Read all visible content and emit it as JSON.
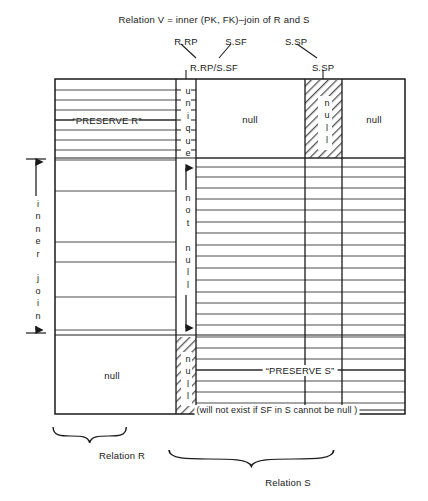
{
  "diagram": {
    "title": "Relation V = inner (PK, FK)–join of R and S",
    "top_labels": [
      {
        "id": "r-rp",
        "text": "R.RP"
      },
      {
        "id": "s-sf",
        "text": "S.SF"
      },
      {
        "id": "s-sp",
        "text": "S.SP"
      }
    ],
    "column_headers": [
      {
        "id": "join-col",
        "text": "R.RP/S.SF"
      },
      {
        "id": "ssp-col",
        "text": "S.SP"
      }
    ],
    "regions": {
      "preserve_r": "“PRESERVE R”",
      "preserve_s": "“PRESERVE S”",
      "null_top_left": "null",
      "null_top_right": "null",
      "null_top_hatched": "null",
      "null_bottom_left": "null",
      "null_bottom_hatched": "null"
    },
    "vertical_labels": {
      "unique": "unique",
      "not_null": "not null",
      "inner_join": "inner join"
    },
    "footnote": "(will not exist if SF in S cannot be null )",
    "braces": [
      {
        "id": "relation-r",
        "label": "Relation R"
      },
      {
        "id": "relation-s",
        "label": "Relation S"
      }
    ],
    "colors": {
      "ink": "#1a1a1a",
      "rule": "#4d4d4d",
      "hatch": "#555555",
      "background": "#ffffff"
    }
  }
}
